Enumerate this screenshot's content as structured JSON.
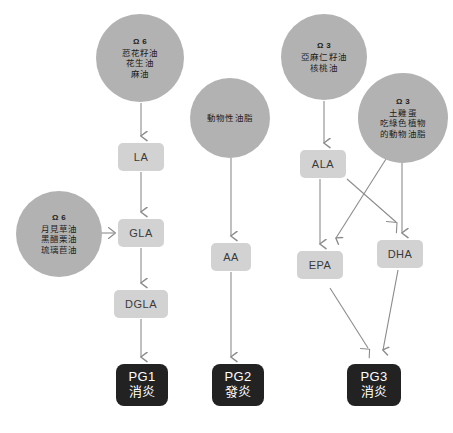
{
  "diagram": {
    "colors": {
      "background": "#ffffff",
      "circle_fill": "#b2b2b2",
      "box_fill": "#d2d2d2",
      "box_text": "#3a3a3a",
      "terminal_fill": "#222222",
      "terminal_text": "#ffffff",
      "arrow": "#8c8c8c"
    },
    "sources": [
      {
        "id": "source-omega6-seed-oils",
        "omega": "Ω 6",
        "lines": [
          "荵花籽油",
          "花生油",
          "麻油"
        ],
        "cx": 140,
        "cy": 58,
        "r": 44
      },
      {
        "id": "source-omega6-evening-primrose",
        "omega": "Ω 6",
        "lines": [
          "月見草油",
          "黑醋栗油",
          "琉璃苣油"
        ],
        "cx": 59,
        "cy": 234,
        "r": 43
      },
      {
        "id": "source-animal-fat",
        "omega": "",
        "lines": [
          "動物性油脂"
        ],
        "cx": 230,
        "cy": 118,
        "r": 40
      },
      {
        "id": "source-omega3-flaxseed",
        "omega": "Ω 3",
        "lines": [
          "亞麻仁籽油",
          "核桃油"
        ],
        "cx": 324,
        "cy": 57,
        "r": 43
      },
      {
        "id": "source-omega3-free-range-egg",
        "omega": "Ω 3",
        "lines": [
          "土雞蛋",
          "吃綠色植物",
          "的動物油脂"
        ],
        "cx": 403,
        "cy": 118,
        "r": 45
      }
    ],
    "metabolites": [
      {
        "id": "node-la",
        "label": "LA",
        "x": 118,
        "y": 143,
        "w": 46,
        "h": 28
      },
      {
        "id": "node-gla",
        "label": "GLA",
        "x": 118,
        "y": 219,
        "w": 46,
        "h": 28
      },
      {
        "id": "node-dgla",
        "label": "DGLA",
        "x": 114,
        "y": 290,
        "w": 54,
        "h": 28
      },
      {
        "id": "node-aa",
        "label": "AA",
        "x": 211,
        "y": 243,
        "w": 40,
        "h": 28
      },
      {
        "id": "node-ala",
        "label": "ALA",
        "x": 300,
        "y": 150,
        "w": 46,
        "h": 28
      },
      {
        "id": "node-epa",
        "label": "EPA",
        "x": 297,
        "y": 251,
        "w": 46,
        "h": 28
      },
      {
        "id": "node-dha",
        "label": "DHA",
        "x": 377,
        "y": 240,
        "w": 46,
        "h": 28
      }
    ],
    "terminals": [
      {
        "id": "terminal-pg1",
        "code": "PG1",
        "effect": "消炎",
        "x": 116,
        "y": 364,
        "w": 52,
        "h": 42
      },
      {
        "id": "terminal-pg2",
        "code": "PG2",
        "effect": "發炎",
        "x": 212,
        "y": 364,
        "w": 52,
        "h": 42
      },
      {
        "id": "terminal-pg3",
        "code": "PG3",
        "effect": "消炎",
        "x": 347,
        "y": 364,
        "w": 54,
        "h": 42
      }
    ],
    "edges": [
      {
        "id": "edge-seedoils-to-la",
        "from": "source-omega6-seed-oils",
        "to": "node-la"
      },
      {
        "id": "edge-la-to-gla",
        "from": "node-la",
        "to": "node-gla"
      },
      {
        "id": "edge-primrose-to-gla",
        "from": "source-omega6-evening-primrose",
        "to": "node-gla"
      },
      {
        "id": "edge-gla-to-dgla",
        "from": "node-gla",
        "to": "node-dgla"
      },
      {
        "id": "edge-dgla-to-pg1",
        "from": "node-dgla",
        "to": "terminal-pg1"
      },
      {
        "id": "edge-animalfat-to-aa",
        "from": "source-animal-fat",
        "to": "node-aa"
      },
      {
        "id": "edge-aa-to-pg2",
        "from": "node-aa",
        "to": "terminal-pg2"
      },
      {
        "id": "edge-flaxseed-to-ala",
        "from": "source-omega3-flaxseed",
        "to": "node-ala"
      },
      {
        "id": "edge-ala-to-epa",
        "from": "node-ala",
        "to": "node-epa"
      },
      {
        "id": "edge-ala-to-dha",
        "from": "node-ala",
        "to": "node-dha"
      },
      {
        "id": "edge-egg-to-epa",
        "from": "source-omega3-free-range-egg",
        "to": "node-epa"
      },
      {
        "id": "edge-egg-to-dha",
        "from": "source-omega3-free-range-egg",
        "to": "node-dha"
      },
      {
        "id": "edge-epa-to-pg3",
        "from": "node-epa",
        "to": "terminal-pg3"
      },
      {
        "id": "edge-dha-to-pg3",
        "from": "node-dha",
        "to": "terminal-pg3"
      }
    ],
    "watermark": ""
  }
}
